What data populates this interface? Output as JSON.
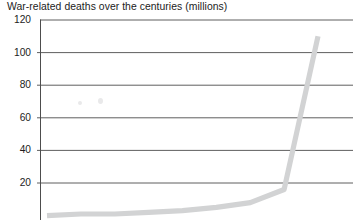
{
  "chart": {
    "title": "War-related deaths over the centuries (millions)",
    "axis_color": "#4d4d4d",
    "grid_color": "#4d4d4d",
    "series_color": "#d2d3d4",
    "background": "#ffffff"
  },
  "chart_data": {
    "type": "line",
    "title": "War-related deaths over the centuries (millions)",
    "xlabel": "",
    "ylabel": "",
    "ylim": [
      0,
      120
    ],
    "yticks": [
      20,
      40,
      60,
      80,
      100,
      120
    ],
    "ytick_labels": [
      "20",
      "40",
      "60",
      "80",
      "100",
      "120"
    ],
    "grid": true,
    "grid_axis": "y",
    "legend": false,
    "x_axis_visible": false,
    "note": "Bottom of the chart including the x-axis and its century tick labels is cropped out of the screenshot.",
    "series": [
      {
        "name": "War-related deaths (millions)",
        "color": "#d2d3d4",
        "x": [
          0,
          1,
          2,
          3,
          4,
          5,
          6,
          7,
          8
        ],
        "values": [
          0,
          1,
          1,
          2,
          3,
          5,
          8,
          16,
          110
        ]
      }
    ],
    "annotations": []
  },
  "ytick_positions_px": {
    "120": 20,
    "100": 52.6,
    "80": 85.2,
    "60": 117.8,
    "40": 150.4,
    "20": 183
  },
  "plot_geometry_px": {
    "axis_x": 40,
    "grid_right": 353,
    "top_y": 20,
    "bottom_y": 220
  }
}
